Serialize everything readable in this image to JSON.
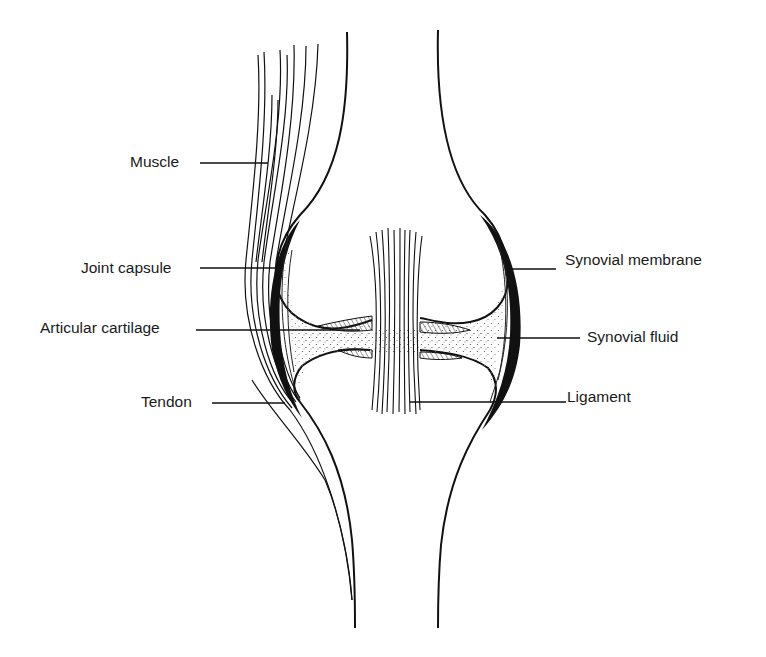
{
  "figure": {
    "ink_color": "#111111",
    "background_color": "#ffffff",
    "fluid_stipple_color": "#555555"
  },
  "labels": {
    "muscle": "Muscle",
    "joint_capsule": "Joint capsule",
    "articular_cartilage": "Articular cartilage",
    "tendon": "Tendon",
    "synovial_membrane": "Synovial membrane",
    "synovial_fluid": "Synovial fluid",
    "ligament": "Ligament"
  }
}
